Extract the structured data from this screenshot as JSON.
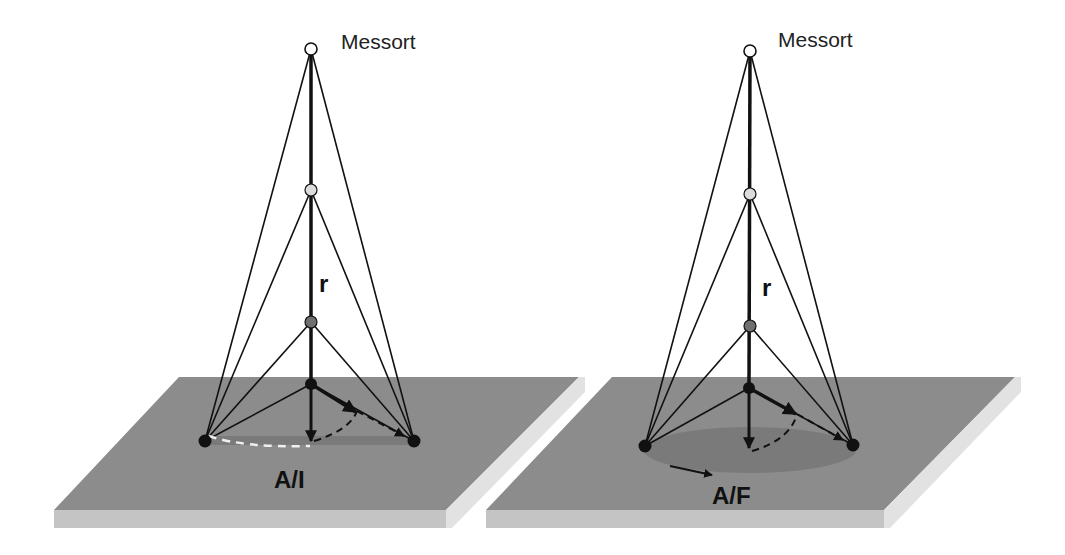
{
  "diagrams": [
    {
      "id": "left",
      "source_label": "Messort",
      "distance_label": "r",
      "plate_label": "A/I",
      "variant": "infinitesimal line source"
    },
    {
      "id": "right",
      "source_label": "Messort",
      "distance_label": "r",
      "plate_label": "A/F",
      "variant": "finite area source"
    }
  ],
  "colors": {
    "plate_top": "#8c8c8c",
    "plate_front": "#c4c4c4",
    "plate_side": "#e2e2e2",
    "source_area": "#7a7a7a",
    "line": "#111111",
    "point_top": "#ffffff",
    "point_2": "#dcdcdc",
    "point_3": "#707070",
    "point_4": "#111111"
  }
}
